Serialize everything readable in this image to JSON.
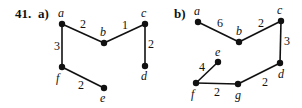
{
  "problem_number": "41.",
  "graphs": [
    {
      "label": "a)",
      "nodes": [
        {
          "id": "a",
          "x": 62,
          "y": 24,
          "lx": 58,
          "ly": 17
        },
        {
          "id": "b",
          "x": 104,
          "y": 43,
          "lx": 100,
          "ly": 36
        },
        {
          "id": "c",
          "x": 145,
          "y": 24,
          "lx": 141,
          "ly": 17
        },
        {
          "id": "d",
          "x": 145,
          "y": 66,
          "lx": 141,
          "ly": 80
        },
        {
          "id": "f",
          "x": 62,
          "y": 67,
          "lx": 56,
          "ly": 82
        },
        {
          "id": "e",
          "x": 104,
          "y": 88,
          "lx": 100,
          "ly": 102
        }
      ],
      "edges": [
        {
          "from": "a",
          "to": "b",
          "weight": "2",
          "wx": 80,
          "wy": 28
        },
        {
          "from": "b",
          "to": "c",
          "weight": "1",
          "wx": 122,
          "wy": 29
        },
        {
          "from": "c",
          "to": "d",
          "weight": "2",
          "wx": 148,
          "wy": 48
        },
        {
          "from": "a",
          "to": "f",
          "weight": "3",
          "wx": 54,
          "wy": 50
        },
        {
          "from": "f",
          "to": "e",
          "weight": "2",
          "wx": 78,
          "wy": 89
        }
      ]
    },
    {
      "label": "b)",
      "nodes": [
        {
          "id": "a",
          "x": 198,
          "y": 22,
          "lx": 194,
          "ly": 15
        },
        {
          "id": "b",
          "x": 239,
          "y": 42,
          "lx": 236,
          "ly": 35
        },
        {
          "id": "c",
          "x": 281,
          "y": 21,
          "lx": 277,
          "ly": 14
        },
        {
          "id": "d",
          "x": 280,
          "y": 63,
          "lx": 278,
          "ly": 78
        },
        {
          "id": "e",
          "x": 218,
          "y": 62,
          "lx": 215,
          "ly": 56
        },
        {
          "id": "f",
          "x": 196,
          "y": 83,
          "lx": 191,
          "ly": 98
        },
        {
          "id": "g",
          "x": 238,
          "y": 84,
          "lx": 235,
          "ly": 99
        }
      ],
      "edges": [
        {
          "from": "a",
          "to": "b",
          "weight": "6",
          "wx": 217,
          "wy": 27
        },
        {
          "from": "b",
          "to": "c",
          "weight": "2",
          "wx": 258,
          "wy": 27
        },
        {
          "from": "c",
          "to": "d",
          "weight": "3",
          "wx": 284,
          "wy": 45
        },
        {
          "from": "d",
          "to": "g",
          "weight": "2",
          "wx": 262,
          "wy": 86
        },
        {
          "from": "g",
          "to": "f",
          "weight": "2",
          "wx": 214,
          "wy": 96
        },
        {
          "from": "f",
          "to": "e",
          "weight": "4",
          "wx": 199,
          "wy": 71
        }
      ]
    }
  ]
}
